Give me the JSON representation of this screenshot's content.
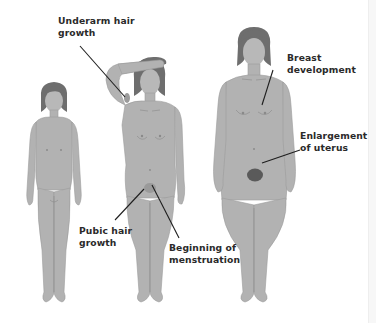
{
  "diagram": {
    "figures": [
      {
        "id": "child",
        "stage": "before puberty"
      },
      {
        "id": "adolescent",
        "stage": "during puberty",
        "pose": "right arm raised over head"
      },
      {
        "id": "adult",
        "stage": "after puberty"
      }
    ],
    "labels": [
      {
        "id": "underarm",
        "line1": "Underarm hair",
        "line2": "growth",
        "target": "adolescent underarm"
      },
      {
        "id": "breast",
        "line1": "Breast",
        "line2": "development",
        "target": "adult breast"
      },
      {
        "id": "uterus",
        "line1": "Enlargement",
        "line2": "of uterus",
        "target": "adult lower abdomen"
      },
      {
        "id": "pubic",
        "line1": "Pubic hair",
        "line2": "growth",
        "target": "adolescent pubic area"
      },
      {
        "id": "menstruation",
        "line1": "Beginning of",
        "line2": "menstruation",
        "target": "adolescent pubic area"
      }
    ],
    "colors": {
      "skin": "#b2b2b2",
      "skin_shade": "#a3a3a3",
      "hair": "#6e6e6e",
      "pubic_hair": "#5a5a5a",
      "leader_line": "#1e1e1e",
      "label_text": "#2a2a2a",
      "background": "#ffffff"
    }
  }
}
